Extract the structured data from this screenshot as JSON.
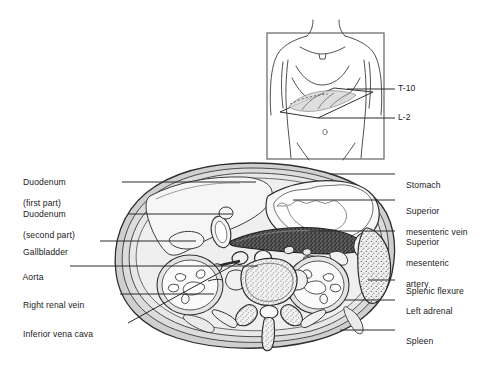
{
  "figure": {
    "background_color": "#ffffff",
    "ink_color": "#1a1a1a"
  },
  "inset": {
    "name": "body-orientation-inset",
    "description": "Anterior torso with oblique transverse section plane",
    "frame_color": "#4a4a4a",
    "labels": [
      {
        "text": "T-10",
        "vertebral_level": "T-10"
      },
      {
        "text": "L-2",
        "vertebral_level": "L-2"
      }
    ]
  },
  "cross_section": {
    "name": "abdominal-cross-section",
    "level": "T-10 to L-2",
    "fill_color": "#d8d8d8",
    "structures": [
      "body wall",
      "liver",
      "stomach",
      "pancreas",
      "duodenum",
      "gallbladder",
      "aorta",
      "inferior vena cava",
      "right kidney",
      "left kidney",
      "vertebral body",
      "spinous process",
      "spleen",
      "left adrenal",
      "splenic flexure"
    ]
  },
  "labels_left": [
    {
      "id": "duodenum-first-part",
      "line1": "Duodenum",
      "line2": "(first part)"
    },
    {
      "id": "duodenum-second-part",
      "line1": "Duodenum",
      "line2": "(second part)"
    },
    {
      "id": "gallbladder",
      "line1": "Gallbladder",
      "line2": ""
    },
    {
      "id": "aorta",
      "line1": "Aorta",
      "line2": ""
    },
    {
      "id": "right-renal-vein",
      "line1": "Right renal vein",
      "line2": ""
    },
    {
      "id": "inferior-vena-cava",
      "line1": "Inferior vena cava",
      "line2": ""
    }
  ],
  "labels_right": [
    {
      "id": "stomach",
      "line1": "Stomach",
      "line2": "",
      "line3": ""
    },
    {
      "id": "superior-mesenteric-vein",
      "line1": "Superior",
      "line2": "mesenteric vein",
      "line3": ""
    },
    {
      "id": "superior-mesenteric-artery",
      "line1": "Superior",
      "line2": "mesenteric",
      "line3": "artery"
    },
    {
      "id": "splenic-flexure",
      "line1": "Splenic flexure",
      "line2": "",
      "line3": ""
    },
    {
      "id": "left-adrenal",
      "line1": "Left adrenal",
      "line2": "",
      "line3": ""
    },
    {
      "id": "spleen",
      "line1": "Spleen",
      "line2": "",
      "line3": ""
    }
  ]
}
